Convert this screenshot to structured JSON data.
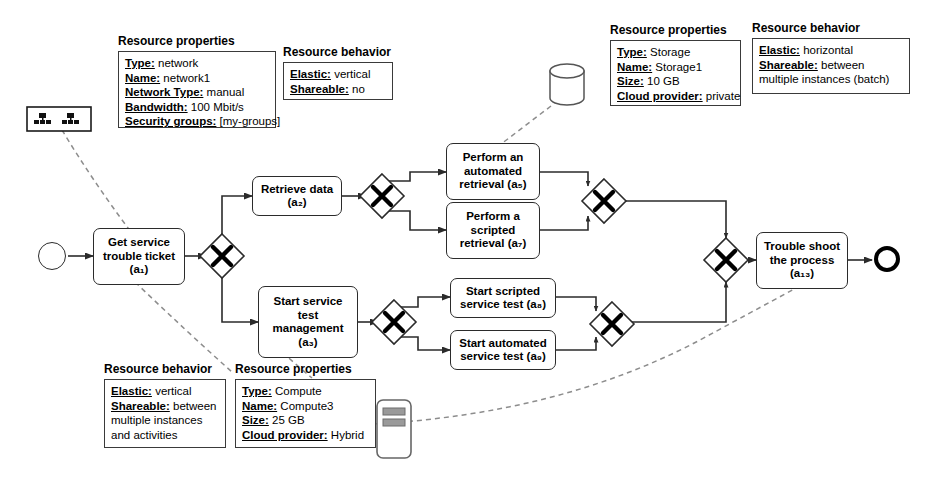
{
  "diagram": {
    "stroke_color": "#2b2b2b",
    "association_color": "#8d8d8d",
    "background": "#ffffff"
  },
  "notes": [
    {
      "id": "network-properties",
      "title": "Resource properties",
      "lines": [
        {
          "key": "Type:",
          "value": "network"
        },
        {
          "key": "Name:",
          "value": "network1"
        },
        {
          "key": "Network Type:",
          "value": "manual"
        },
        {
          "key": "Bandwidth:",
          "value": "100 Mbit/s"
        },
        {
          "key": "Security groups:",
          "value": "[my-groups]"
        }
      ]
    },
    {
      "id": "network-behavior",
      "title": "Resource behavior",
      "lines": [
        {
          "key": "Elastic:",
          "value": "vertical"
        },
        {
          "key": "Shareable:",
          "value": "no"
        }
      ]
    },
    {
      "id": "storage-properties",
      "title": "Resource properties",
      "lines": [
        {
          "key": "Type:",
          "value": "Storage"
        },
        {
          "key": "Name:",
          "value": "Storage1"
        },
        {
          "key": "Size:",
          "value": "10 GB"
        },
        {
          "key": "Cloud provider:",
          "value": "private"
        }
      ]
    },
    {
      "id": "storage-behavior",
      "title": "Resource behavior",
      "lines": [
        {
          "key": "Elastic:",
          "value": "horizontal"
        },
        {
          "key": "Shareable:",
          "value": "between"
        },
        {
          "key": "",
          "value": "multiple instances (batch)"
        }
      ]
    },
    {
      "id": "compute-behavior",
      "title": "Resource behavior",
      "lines": [
        {
          "key": "Elastic:",
          "value": "vertical"
        },
        {
          "key": "Shareable:",
          "value": "between"
        },
        {
          "key": "",
          "value": "multiple instances"
        },
        {
          "key": "",
          "value": "and activities"
        }
      ]
    },
    {
      "id": "compute-properties",
      "title": "Resource properties",
      "lines": [
        {
          "key": "Type:",
          "value": "Compute"
        },
        {
          "key": "Name:",
          "value": "Compute3"
        },
        {
          "key": "Size:",
          "value": "25 GB"
        },
        {
          "key": "Cloud provider:",
          "value": "Hybrid"
        }
      ]
    }
  ],
  "tasks": [
    {
      "id": "a1",
      "label": "Get service trouble ticket",
      "ref": "a",
      "sub": "1"
    },
    {
      "id": "a2",
      "label": "Retrieve data",
      "ref": "a",
      "sub": "2"
    },
    {
      "id": "a3",
      "label": "Start service test management",
      "ref": "a",
      "sub": "3"
    },
    {
      "id": "a5",
      "label": "Perform an automated retrieval",
      "ref": "a",
      "sub": "5"
    },
    {
      "id": "a7",
      "label": "Perform a scripted retrieval",
      "ref": "a",
      "sub": "7"
    },
    {
      "id": "a8",
      "label": "Start scripted service test",
      "ref": "a",
      "sub": "8"
    },
    {
      "id": "a9",
      "label": "Start automated service test",
      "ref": "a",
      "sub": "9"
    },
    {
      "id": "a13",
      "label": "Trouble shoot the process",
      "ref": "a",
      "sub": "13"
    }
  ],
  "task_text": {
    "a1_l1": "Get service",
    "a1_l2": "trouble ticket",
    "a1_l3": "(a₁)",
    "a2_l1": "Retrieve data",
    "a2_l2": "(a₂)",
    "a3_l1": "Start service",
    "a3_l2": "test",
    "a3_l3": "management",
    "a3_l4": "(a₃)",
    "a5_l1": "Perform an",
    "a5_l2": "automated",
    "a5_l3": "retrieval (a₅)",
    "a7_l1": "Perform a",
    "a7_l2": "scripted",
    "a7_l3": "retrieval (a₇)",
    "a8_l1": "Start scripted",
    "a8_l2": "service test (a₈)",
    "a9_l1": "Start automated",
    "a9_l2": "service test (a₉)",
    "a13_l1": "Trouble shoot",
    "a13_l2": "the process",
    "a13_l3": "(a₁₃)"
  },
  "gateways": [
    {
      "id": "gw-split-main",
      "type": "exclusive",
      "marker": "X"
    },
    {
      "id": "gw-split-retrieve",
      "type": "exclusive",
      "marker": "X"
    },
    {
      "id": "gw-merge-retrieve",
      "type": "exclusive",
      "marker": "X"
    },
    {
      "id": "gw-split-test",
      "type": "exclusive",
      "marker": "X"
    },
    {
      "id": "gw-merge-test",
      "type": "exclusive",
      "marker": "X"
    },
    {
      "id": "gw-merge-main",
      "type": "exclusive",
      "marker": "X"
    }
  ],
  "events": [
    {
      "id": "start-event",
      "type": "start"
    },
    {
      "id": "end-event",
      "type": "end"
    }
  ],
  "resources": [
    {
      "id": "network-icon",
      "icon": "network-icon",
      "label": "network1"
    },
    {
      "id": "storage-icon",
      "icon": "database-cylinder-icon",
      "label": "Storage1"
    },
    {
      "id": "compute-icon",
      "icon": "server-icon",
      "label": "Compute3"
    }
  ]
}
